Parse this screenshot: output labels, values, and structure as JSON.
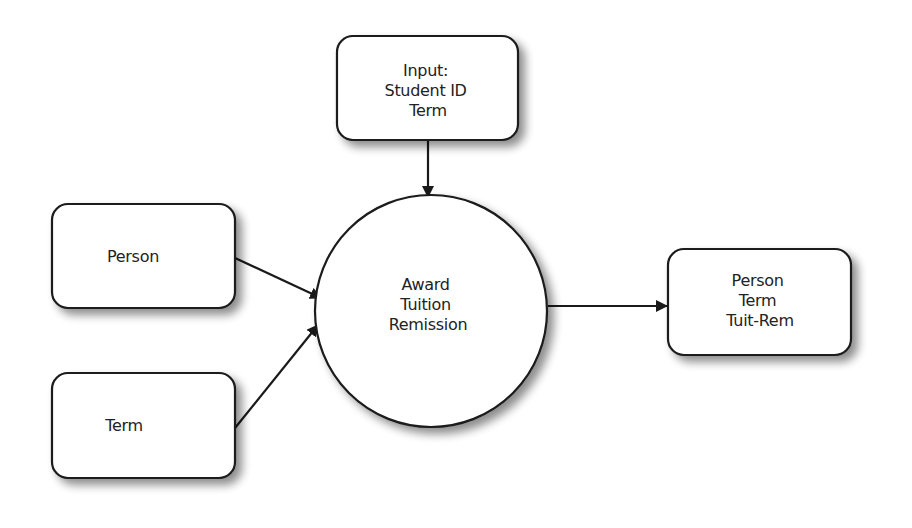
{
  "diagram": {
    "type": "data-flow",
    "colors": {
      "stroke": "#1a1a1a",
      "fill": "#ffffff",
      "text": "#222222",
      "shadow": "#9a9a9a"
    },
    "nodes": {
      "input": {
        "shape": "rounded-rect",
        "lines": [
          "Input:",
          "Student ID",
          "Term"
        ]
      },
      "person": {
        "shape": "rounded-rect",
        "lines": [
          "Person"
        ]
      },
      "term": {
        "shape": "rounded-rect",
        "lines": [
          "Term"
        ]
      },
      "process": {
        "shape": "circle",
        "lines": [
          "Award",
          "Tuition",
          "Remission"
        ]
      },
      "output": {
        "shape": "rounded-rect",
        "lines": [
          "Person",
          "Term",
          "Tuit-Rem"
        ]
      }
    },
    "edges": [
      {
        "from": "input",
        "to": "process"
      },
      {
        "from": "person",
        "to": "process"
      },
      {
        "from": "term",
        "to": "process"
      },
      {
        "from": "process",
        "to": "output"
      }
    ]
  }
}
